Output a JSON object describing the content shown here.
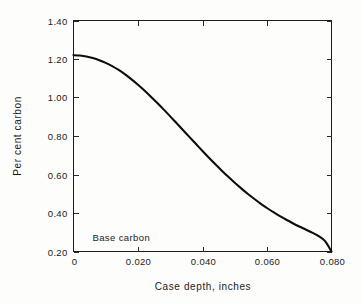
{
  "figure": {
    "name": "case-depth-carbon-gradient",
    "background_color": "#fdfdfb",
    "line_color": "#0d0d0d",
    "axis_color": "#1a1a1a"
  },
  "annotation": {
    "base_carbon_label": "Base carbon"
  },
  "chart_data": {
    "type": "line",
    "title": "",
    "subtitle": "",
    "xlabel": "Case depth, inches",
    "ylabel": "Per cent carbon",
    "xlim": [
      0,
      0.08
    ],
    "ylim": [
      0.2,
      1.4
    ],
    "grid": false,
    "legend": null,
    "legend_position": "none",
    "xticks": [
      0,
      0.02,
      0.04,
      0.06,
      0.08
    ],
    "xtick_labels": [
      "0",
      "0.020",
      "0.040",
      "0.060",
      "0.080"
    ],
    "yticks": [
      0.2,
      0.4,
      0.6,
      0.8,
      1.0,
      1.2,
      1.4
    ],
    "ytick_labels": [
      "0.20",
      "0.40",
      "0.60",
      "0.80",
      "1.00",
      "1.20",
      "1.40"
    ],
    "tick_direction": "in",
    "annotations": [
      {
        "text": "Base carbon",
        "x": 0.004,
        "y": 0.255
      }
    ],
    "series": [
      {
        "name": "carbon gradient",
        "color": "#0d0d0d",
        "x": [
          0.0,
          0.002,
          0.004,
          0.006,
          0.008,
          0.01,
          0.012,
          0.014,
          0.016,
          0.018,
          0.02,
          0.022,
          0.024,
          0.026,
          0.028,
          0.03,
          0.032,
          0.034,
          0.036,
          0.038,
          0.04,
          0.042,
          0.044,
          0.046,
          0.048,
          0.05,
          0.052,
          0.054,
          0.056,
          0.058,
          0.06,
          0.062,
          0.064,
          0.066,
          0.068,
          0.07,
          0.072,
          0.074,
          0.076,
          0.078,
          0.08
        ],
        "y": [
          1.22,
          1.218,
          1.213,
          1.205,
          1.194,
          1.18,
          1.163,
          1.143,
          1.12,
          1.094,
          1.066,
          1.036,
          1.004,
          0.971,
          0.937,
          0.902,
          0.866,
          0.83,
          0.794,
          0.758,
          0.722,
          0.687,
          0.653,
          0.62,
          0.588,
          0.557,
          0.528,
          0.5,
          0.474,
          0.449,
          0.426,
          0.404,
          0.384,
          0.365,
          0.347,
          0.33,
          0.314,
          0.298,
          0.28,
          0.254,
          0.2
        ]
      }
    ]
  }
}
